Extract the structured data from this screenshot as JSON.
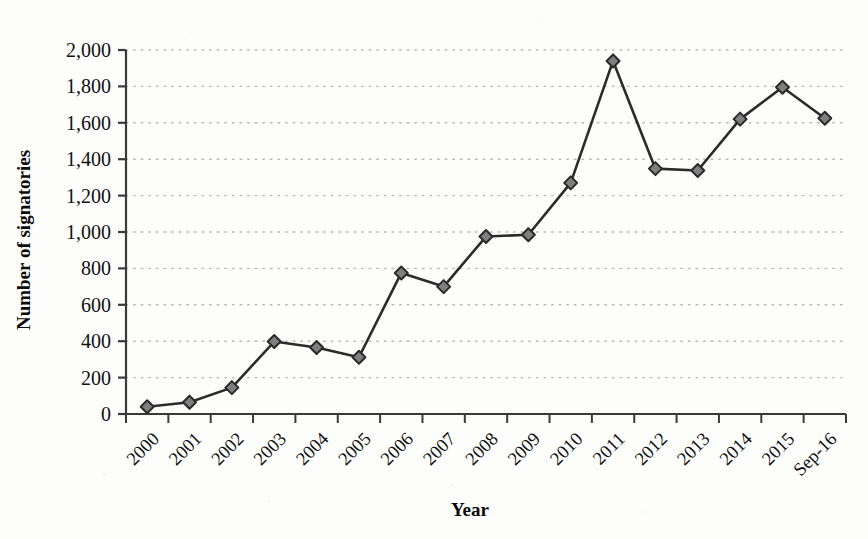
{
  "chart_data": {
    "type": "line",
    "title": "",
    "subtitle": "",
    "xlabel": "Year",
    "ylabel": "Number of signatories",
    "categories": [
      "2000",
      "2001",
      "2002",
      "2003",
      "2004",
      "2005",
      "2006",
      "2007",
      "2008",
      "2009",
      "2010",
      "2011",
      "2012",
      "2013",
      "2014",
      "2015",
      "Sep-16"
    ],
    "values": [
      40,
      65,
      145,
      398,
      365,
      312,
      775,
      700,
      975,
      985,
      1270,
      1940,
      1348,
      1338,
      1620,
      1795,
      1625
    ],
    "series": [
      {
        "name": "Number of signatories",
        "values": [
          40,
          65,
          145,
          398,
          365,
          312,
          775,
          700,
          975,
          985,
          1270,
          1940,
          1348,
          1338,
          1620,
          1795,
          1625
        ]
      }
    ],
    "ylim": [
      0,
      2000
    ],
    "ytick_values": [
      0,
      200,
      400,
      600,
      800,
      1000,
      1200,
      1400,
      1600,
      1800,
      2000
    ],
    "ytick_labels": [
      "0",
      "200",
      "400",
      "600",
      "800",
      "1,000",
      "1,200",
      "1,400",
      "1,600",
      "1,800",
      "2,000"
    ],
    "xtick_labels": [
      "2000",
      "2001",
      "2002",
      "2003",
      "2004",
      "2005",
      "2006",
      "2007",
      "2008",
      "2009",
      "2010",
      "2011",
      "2012",
      "2013",
      "2014",
      "2015",
      "Sep-16"
    ],
    "xtick_rotation_deg": 45,
    "grid": {
      "horizontal": true,
      "vertical": false,
      "style": "dotted",
      "color": "#b9b9b9"
    },
    "legend": {
      "visible": false,
      "position": "none"
    },
    "marker": {
      "shape": "diamond",
      "fill_color": "#7f7f7f",
      "edge_color": "#2b2b2b",
      "size_px": 13
    },
    "line": {
      "color": "#2b2b2b",
      "width_px": 2.6,
      "style": "solid"
    },
    "axis": {
      "color": "#3a3a3a",
      "tick_color": "#3a3a3a"
    },
    "background_color": "#fdfdfc"
  }
}
